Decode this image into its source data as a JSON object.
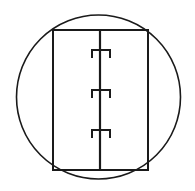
{
  "figure": {
    "background_color": "#ffffff",
    "line_color": "#1a1a1a",
    "canvas": {
      "width": 195,
      "height": 191
    },
    "circle": {
      "name": "outer-circle",
      "center_x": 98.5,
      "center_y": 97,
      "radius": 82,
      "stroke_width": 1.6
    },
    "rectangle": {
      "name": "door-panel",
      "x": 53,
      "y": 30,
      "width": 95,
      "height": 140,
      "stroke_width": 2.0
    },
    "divider": {
      "name": "center-stile",
      "x": 100,
      "y_top": 30,
      "y_bottom": 170,
      "stroke_width": 2.2
    },
    "hinges": [
      {
        "label": "hinge-top",
        "center_y": 54,
        "x_left": 92,
        "x_right": 110,
        "height": 8
      },
      {
        "label": "hinge-middle",
        "center_y": 94,
        "x_left": 92,
        "x_right": 110,
        "height": 8
      },
      {
        "label": "hinge-bottom",
        "center_y": 134,
        "x_left": 92,
        "x_right": 110,
        "height": 8
      }
    ]
  }
}
